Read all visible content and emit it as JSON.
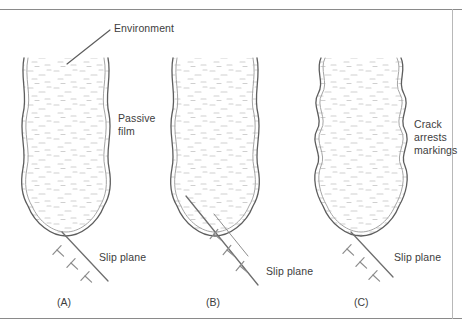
{
  "figure": {
    "title_alt": "Schematic of crack propagation by slip-dissolution showing passive film rupture at a crack tip",
    "colors": {
      "crack_wall": "#5d5d5d",
      "inner_wall": "#9a9a9a",
      "stipple": "#c9c9c9",
      "text": "#3d3d3d",
      "rule": "#8a8a8a",
      "background": "#ffffff"
    }
  },
  "annotations": {
    "environment": "Environment",
    "passive_film_line1": "Passive",
    "passive_film_line2": "film",
    "crack_arrest_line1": "Crack",
    "crack_arrest_line2": "arrests",
    "crack_arrest_line3": "markings",
    "slip_plane_a": "Slip plane",
    "slip_plane_b": "Slip plane",
    "slip_plane_c": "Slip plane"
  },
  "panels": [
    {
      "id": "A",
      "caption": "(A)",
      "slip_plane_label": "Slip plane",
      "dislocation_count": 3
    },
    {
      "id": "B",
      "caption": "(B)",
      "slip_plane_label": "Slip plane",
      "dislocation_count": 3
    },
    {
      "id": "C",
      "caption": "(C)",
      "slip_plane_label": "Slip plane",
      "dislocation_count": 3
    }
  ]
}
